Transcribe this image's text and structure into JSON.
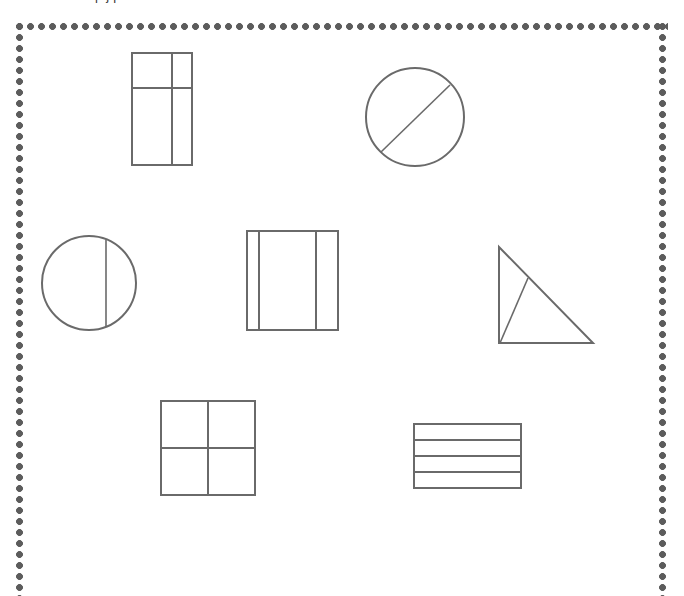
{
  "page": {
    "width": 684,
    "height": 596,
    "background_color": "#ffffff",
    "partial_top_text": "p                     j      p",
    "frame": {
      "style": "dotted-border",
      "dot_color": "#5c5c5c",
      "dot_radius": 3.1,
      "dot_spacing": 11,
      "left": 14,
      "top": 21,
      "width": 654,
      "height": 575,
      "bottom_edge_visible": false
    }
  },
  "figure": {
    "stroke_color": "#6a6a6a",
    "stroke_width": 2,
    "fill_color": "none",
    "shape_count": 7,
    "shapes": [
      {
        "id": "shape-1",
        "name": "rectangle-with-cross-lines",
        "label": "Tall rectangle divided by one vertical line and one horizontal line",
        "type": "rectangle",
        "x": 132,
        "y": 53,
        "width": 60,
        "height": 112,
        "divider_count": 2,
        "dividers": "vertical at 66%, horizontal at 31%"
      },
      {
        "id": "shape-2",
        "name": "circle-with-diagonal-chord",
        "label": "Circle divided by a diagonal line",
        "type": "circle",
        "cx": 415,
        "cy": 117,
        "r": 49,
        "divider_count": 1,
        "dividers": "diagonal chord from lower-left to upper-right"
      },
      {
        "id": "shape-3",
        "name": "circle-with-vertical-chord",
        "label": "Circle divided by an off-centre vertical line",
        "type": "circle",
        "cx": 89,
        "cy": 283,
        "r": 47,
        "divider_count": 1,
        "dividers": "vertical chord right of centre"
      },
      {
        "id": "shape-4",
        "name": "square-with-two-vertical-lines",
        "label": "Square divided by two vertical lines",
        "type": "square",
        "x": 247,
        "y": 231,
        "width": 91,
        "height": 99,
        "divider_count": 2,
        "dividers": "vertical lines at 13% and 76%"
      },
      {
        "id": "shape-5",
        "name": "right-triangle-with-interior-line",
        "label": "Right triangle divided by a line to the hypotenuse",
        "type": "triangle",
        "x": 498,
        "y": 246,
        "width": 96,
        "height": 98,
        "divider_count": 1,
        "dividers": "line from bottom-left vertex to hypotenuse"
      },
      {
        "id": "shape-6",
        "name": "square-quartered",
        "label": "Square divided into four equal parts",
        "type": "square",
        "x": 161,
        "y": 401,
        "width": 94,
        "height": 94,
        "divider_count": 2,
        "dividers": "one vertical and one horizontal line through the centre"
      },
      {
        "id": "shape-7",
        "name": "rectangle-with-horizontal-bands",
        "label": "Rectangle divided into four horizontal bands",
        "type": "rectangle",
        "x": 414,
        "y": 424,
        "width": 107,
        "height": 64,
        "divider_count": 3,
        "dividers": "three evenly spaced horizontal lines"
      }
    ]
  }
}
